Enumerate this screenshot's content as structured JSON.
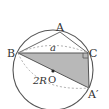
{
  "diagram": {
    "type": "geometry-circumcircle",
    "labels": {
      "A": "A",
      "B": "B",
      "C": "C",
      "A_prime": "A′",
      "O": "O",
      "side_a": "a",
      "diameter": "2R"
    },
    "colors": {
      "stroke": "#555555",
      "fill_triangle": "#b8b8b8",
      "dashed": "#999999",
      "background": "#ffffff"
    }
  }
}
